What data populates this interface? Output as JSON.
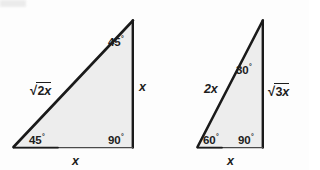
{
  "figure": {
    "type": "geometry-diagram",
    "background_color": "#fdfdfd",
    "fill_color": "#ededed",
    "stroke_color": "#1a1a1a",
    "triangles": [
      {
        "name": "45-45-90 triangle",
        "vertices": {
          "apex": [
            133,
            20
          ],
          "bottom_left": [
            13,
            147
          ],
          "bottom_right": [
            133,
            147
          ]
        },
        "angles": {
          "top": {
            "value": "45",
            "degree": "°"
          },
          "bottom_left": {
            "value": "45",
            "degree": "°"
          },
          "bottom_right": {
            "value": "90",
            "degree": "°"
          }
        },
        "sides": {
          "hypotenuse": {
            "radical": "√",
            "radicand_number": "2",
            "radicand_variable": "x"
          },
          "vertical": "x",
          "base": "x"
        }
      },
      {
        "name": "30-60-90 triangle",
        "vertices": {
          "apex": [
            263,
            20
          ],
          "bottom_left": [
            197,
            147
          ],
          "bottom_right": [
            263,
            147
          ]
        },
        "angles": {
          "top": {
            "value": "30",
            "degree": "°"
          },
          "bottom_left": {
            "value": "60",
            "degree": "°"
          },
          "bottom_right": {
            "value": "90",
            "degree": "°"
          }
        },
        "sides": {
          "hypotenuse": "2x",
          "vertical": {
            "radical": "√",
            "radicand_number": "3",
            "radicand_variable": "x"
          },
          "base": "x"
        }
      }
    ]
  }
}
